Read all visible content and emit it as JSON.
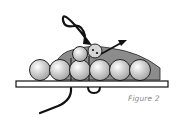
{
  "figure": {
    "caption": "Figure 2",
    "colors": {
      "bead_fill": "#bdbdbd",
      "bead_highlight": "#ffffff",
      "bead_outline": "#222222",
      "mound_fill": "#8c8c8c",
      "thread": "#111111",
      "bar_fill": "#ffffff",
      "caption": "#8a8a8a"
    },
    "bottom_row_beads": [
      {
        "cx": 40,
        "cy": 70,
        "r": 10.5
      },
      {
        "cx": 60,
        "cy": 70,
        "r": 10.5
      },
      {
        "cx": 80,
        "cy": 70,
        "r": 10.5
      },
      {
        "cx": 100,
        "cy": 70,
        "r": 10.5
      },
      {
        "cx": 120,
        "cy": 70,
        "r": 10.5
      },
      {
        "cx": 140,
        "cy": 70,
        "r": 10.5
      }
    ],
    "top_row_beads": [
      {
        "cx": 80,
        "cy": 54,
        "r": 7.5,
        "type": "plain"
      },
      {
        "cx": 95,
        "cy": 51,
        "r": 7,
        "type": "thread-hole"
      }
    ],
    "arrows": [
      {
        "name": "thread-in-arrow",
        "tip": [
          90,
          45
        ]
      },
      {
        "name": "thread-out-arrow",
        "tip": [
          127,
          40
        ]
      }
    ]
  }
}
